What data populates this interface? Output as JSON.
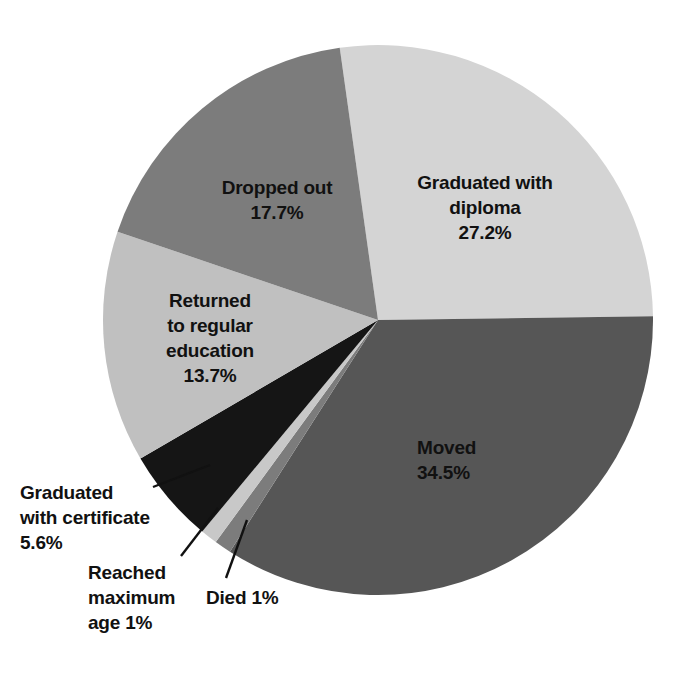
{
  "chart_data": {
    "type": "pie",
    "title": "",
    "subtitle": "",
    "xlabel": "",
    "ylabel": "",
    "legend_position": "none",
    "grid": false,
    "start_angle_deg": -8,
    "direction": "clockwise",
    "center": {
      "x": 378,
      "y": 320
    },
    "radius": 275,
    "categories": [
      "Graduated with diploma",
      "Moved",
      "Died",
      "Reached maximum age",
      "Graduated with certificate",
      "Returned to regular education",
      "Dropped out"
    ],
    "values": [
      27.2,
      34.5,
      1,
      1,
      5.6,
      13.7,
      17.7
    ],
    "value_labels": [
      "27.2%",
      "34.5%",
      "1%",
      "1%",
      "5.6%",
      "13.7%",
      "17.7%"
    ],
    "colors": [
      "#d4d4d4",
      "#565656",
      "#7c7c7c",
      "#c8c8c8",
      "#151515",
      "#c0c0c0",
      "#7c7c7c"
    ],
    "slices": [
      {
        "name": "graduated-with-diploma",
        "label": "Graduated with\ndiploma",
        "value_label": "27.2%",
        "value": 27.2,
        "color": "#d4d4d4"
      },
      {
        "name": "moved",
        "label": "Moved",
        "value_label": "34.5%",
        "value": 34.5,
        "color": "#565656"
      },
      {
        "name": "died",
        "label": "Died 1%",
        "value_label": "1%",
        "value": 1,
        "color": "#7c7c7c"
      },
      {
        "name": "reached-maximum-age",
        "label": "Reached\nmaximum\nage 1%",
        "value_label": "1%",
        "value": 1,
        "color": "#c8c8c8"
      },
      {
        "name": "graduated-with-certificate",
        "label": "Graduated\nwith certificate\n5.6%",
        "value_label": "5.6%",
        "value": 5.6,
        "color": "#151515"
      },
      {
        "name": "returned-to-regular-education",
        "label": "Returned\nto regular\neducation\n13.7%",
        "value_label": "13.7%",
        "value": 13.7,
        "color": "#c0c0c0"
      },
      {
        "name": "dropped-out",
        "label": "Dropped out\n17.7%",
        "value_label": "17.7%",
        "value": 17.7,
        "color": "#7c7c7c"
      }
    ],
    "inline_labels": {
      "graduated_diploma": "Graduated with\ndiploma\n27.2%",
      "dropped_out": "Dropped out\n17.7%",
      "returned": "Returned\nto regular\neducation\n13.7%",
      "moved": "Moved\n34.5%",
      "graduated_certificate": "Graduated\nwith certificate\n5.6%",
      "reached_max_age": "Reached\nmaximum\nage 1%",
      "died": "Died 1%"
    },
    "background_color": "#ffffff",
    "text_color": "#111111"
  }
}
